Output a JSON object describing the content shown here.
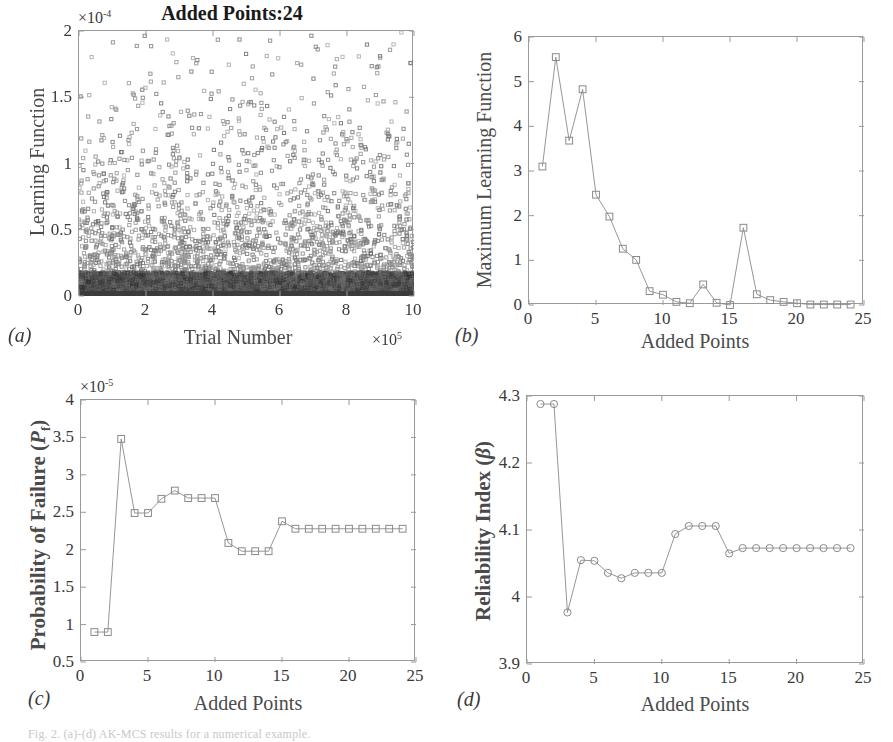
{
  "figure": {
    "caption": "Fig. 2. (a)-(d) AK-MCS results for a numerical example.",
    "panels": [
      "a",
      "b",
      "c",
      "d"
    ]
  },
  "panel_a": {
    "letter": "(a)",
    "title": "Added Points:24",
    "xlabel": "Trial Number",
    "ylabel": "Learning Function",
    "x_multiplier": "×10",
    "x_multiplier_exp": "5",
    "y_multiplier": "×10",
    "y_multiplier_exp": "-4",
    "xticks": [
      "0",
      "2",
      "4",
      "6",
      "8",
      "10"
    ],
    "yticks": [
      "0",
      "0.5",
      "1",
      "1.5",
      "2"
    ],
    "marker": "square",
    "marker_color": "#7a7a7a"
  },
  "panel_b": {
    "letter": "(b)",
    "xlabel": "Added Points",
    "ylabel": "Maximum Learning Function",
    "xticks": [
      "0",
      "5",
      "10",
      "15",
      "20",
      "25"
    ],
    "yticks": [
      "0",
      "1",
      "2",
      "3",
      "4",
      "5",
      "6"
    ],
    "marker": "square",
    "marker_color": "#8a8a8a"
  },
  "panel_c": {
    "letter": "(c)",
    "xlabel": "Added Points",
    "ylabel_main": "Probability of Failure (",
    "ylabel_sym": "P",
    "ylabel_sub": "f",
    "ylabel_close": ")",
    "y_multiplier": "×10",
    "y_multiplier_exp": "-5",
    "xticks": [
      "0",
      "5",
      "10",
      "15",
      "20",
      "25"
    ],
    "yticks": [
      "0.5",
      "1",
      "1.5",
      "2",
      "2.5",
      "3",
      "3.5",
      "4"
    ],
    "marker": "square",
    "marker_color": "#8a8a8a"
  },
  "panel_d": {
    "letter": "(d)",
    "xlabel": "Added Points",
    "ylabel_main": "Reliability Index (",
    "ylabel_sym": "β",
    "ylabel_close": ")",
    "xticks": [
      "0",
      "5",
      "10",
      "15",
      "20",
      "25"
    ],
    "yticks": [
      "3.9",
      "4",
      "4.1",
      "4.2",
      "4.3"
    ],
    "marker": "circle",
    "marker_color": "#8a8a8a"
  },
  "chart_data": [
    {
      "id": "a",
      "type": "scatter",
      "title": "Added Points:24",
      "xlabel": "Trial Number",
      "ylabel": "Learning Function",
      "xlim": [
        0,
        10
      ],
      "ylim": [
        0,
        2
      ],
      "x_scale_note": "values ×10^5",
      "y_scale_note": "values ×10^-4",
      "grid": false,
      "n_points": 2600,
      "description": "Dense scatter of learning-function values over one million Monte-Carlo trials; density decays exponentially with height, forming a saturated black band near y=0 and sparse open squares up to y=2.",
      "density_profile": {
        "model": "exponential",
        "decay_lambda": 2.1,
        "saturated_band_max_y": 0.18,
        "sparse_region_min_y": 0.2
      }
    },
    {
      "id": "b",
      "type": "line",
      "xlabel": "Added Points",
      "ylabel": "Maximum Learning Function",
      "xlim": [
        0,
        25
      ],
      "ylim": [
        0,
        6
      ],
      "grid": false,
      "x": [
        1,
        2,
        3,
        4,
        5,
        6,
        7,
        8,
        9,
        10,
        11,
        12,
        13,
        14,
        15,
        16,
        17,
        18,
        19,
        20,
        21,
        22,
        23,
        24
      ],
      "values": [
        3.1,
        5.55,
        3.68,
        4.83,
        2.47,
        1.98,
        1.26,
        1.01,
        0.31,
        0.23,
        0.07,
        0.04,
        0.46,
        0.05,
        0.0,
        1.73,
        0.24,
        0.11,
        0.07,
        0.04,
        0.01,
        0.01,
        0.01,
        0.01
      ]
    },
    {
      "id": "c",
      "type": "line",
      "xlabel": "Added Points",
      "ylabel": "Probability of Failure (Pf)",
      "xlim": [
        0,
        25
      ],
      "ylim": [
        0.5,
        4
      ],
      "y_scale_note": "values ×10^-5",
      "grid": false,
      "x": [
        1,
        2,
        3,
        4,
        5,
        6,
        7,
        8,
        9,
        10,
        11,
        12,
        13,
        14,
        15,
        16,
        17,
        18,
        19,
        20,
        21,
        22,
        23,
        24
      ],
      "values": [
        0.9,
        0.9,
        3.48,
        2.49,
        2.49,
        2.68,
        2.79,
        2.69,
        2.69,
        2.69,
        2.09,
        1.98,
        1.98,
        1.98,
        2.38,
        2.28,
        2.28,
        2.28,
        2.28,
        2.28,
        2.28,
        2.28,
        2.28,
        2.28
      ]
    },
    {
      "id": "d",
      "type": "line",
      "xlabel": "Added Points",
      "ylabel": "Reliability Index (β)",
      "xlim": [
        0,
        25
      ],
      "ylim": [
        3.9,
        4.3
      ],
      "grid": false,
      "x": [
        1,
        2,
        3,
        4,
        5,
        6,
        7,
        8,
        9,
        10,
        11,
        12,
        13,
        14,
        15,
        16,
        17,
        18,
        19,
        20,
        21,
        22,
        23,
        24
      ],
      "values": [
        4.288,
        4.288,
        3.977,
        4.055,
        4.054,
        4.036,
        4.028,
        4.036,
        4.036,
        4.036,
        4.094,
        4.106,
        4.106,
        4.106,
        4.065,
        4.073,
        4.073,
        4.073,
        4.073,
        4.073,
        4.073,
        4.073,
        4.073,
        4.073
      ]
    }
  ]
}
